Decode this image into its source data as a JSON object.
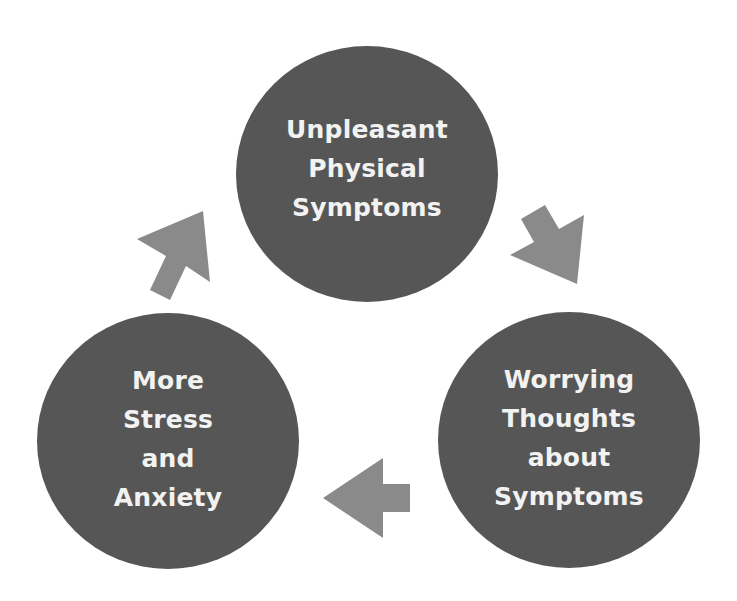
{
  "diagram": {
    "type": "cycle",
    "nodes": [
      {
        "id": "top",
        "label": "Unpleasant\nPhysical\nSymptoms"
      },
      {
        "id": "right",
        "label": "Worrying\nThoughts\nabout\nSymptoms"
      },
      {
        "id": "left",
        "label": "More\nStress\nand\nAnxiety"
      }
    ],
    "edges": [
      {
        "from": "top",
        "to": "right",
        "icon": "arrow-down-right-icon"
      },
      {
        "from": "right",
        "to": "left",
        "icon": "arrow-left-icon"
      },
      {
        "from": "left",
        "to": "top",
        "icon": "arrow-up-right-icon"
      }
    ],
    "colors": {
      "node_fill": "#565656",
      "node_text": "#f2f2f2",
      "arrow_fill": "#8a8a8a",
      "background": "#ffffff"
    }
  }
}
